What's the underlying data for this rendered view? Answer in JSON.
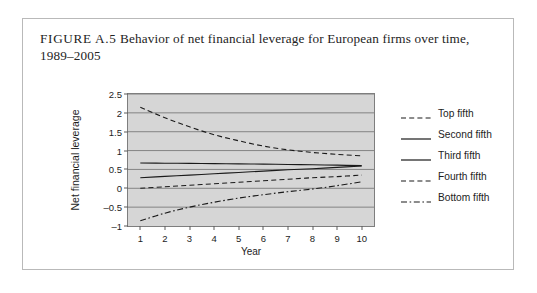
{
  "figure": {
    "label": "FIGURE A.5",
    "caption": "Behavior of net financial leverage for European firms over time, 1989–2005"
  },
  "colors": {
    "plot_background": "#d6d6d6",
    "grid": "#6f6f6f",
    "line": "#1a1a1a",
    "frame": "#7e7e7e",
    "card_border": "#b9b9b9"
  },
  "chart_data": {
    "type": "line",
    "title": "Behavior of net financial leverage for European firms over time, 1989–2005",
    "xlabel": "Year",
    "ylabel": "Net financial leverage",
    "x": [
      1,
      2,
      3,
      4,
      5,
      6,
      7,
      8,
      9,
      10
    ],
    "categories": [
      "1",
      "2",
      "3",
      "4",
      "5",
      "6",
      "7",
      "8",
      "9",
      "10"
    ],
    "xlim": [
      0.5,
      10.5
    ],
    "ylim": [
      -1,
      2.5
    ],
    "yticks": [
      -1,
      -0.5,
      0,
      0.5,
      1,
      1.5,
      2,
      2.5
    ],
    "ytick_labels": [
      "–1",
      "–0.5",
      "0",
      "0.5",
      "1",
      "1.5",
      "2",
      "2.5"
    ],
    "xticks": [
      1,
      2,
      3,
      4,
      5,
      6,
      7,
      8,
      9,
      10
    ],
    "grid": true,
    "grid_axis": "y",
    "legend_position": "right",
    "series": [
      {
        "name": "Top fifth",
        "style": "dashed",
        "values": [
          2.15,
          1.87,
          1.63,
          1.42,
          1.26,
          1.12,
          1.02,
          0.95,
          0.9,
          0.86
        ]
      },
      {
        "name": "Second fifth",
        "style": "solid",
        "values": [
          0.67,
          0.665,
          0.66,
          0.655,
          0.648,
          0.64,
          0.632,
          0.623,
          0.613,
          0.6
        ]
      },
      {
        "name": "Third fifth",
        "style": "solid",
        "values": [
          0.28,
          0.315,
          0.35,
          0.385,
          0.42,
          0.455,
          0.49,
          0.52,
          0.555,
          0.59
        ]
      },
      {
        "name": "Fourth fifth",
        "style": "dashed",
        "values": [
          0.0,
          0.04,
          0.08,
          0.12,
          0.16,
          0.2,
          0.24,
          0.28,
          0.31,
          0.35
        ]
      },
      {
        "name": "Bottom fifth",
        "style": "dashdot",
        "values": [
          -0.86,
          -0.66,
          -0.5,
          -0.37,
          -0.26,
          -0.17,
          -0.09,
          -0.02,
          0.07,
          0.17
        ]
      }
    ]
  },
  "legend": {
    "items": [
      {
        "label": "Top fifth",
        "style": "dashed"
      },
      {
        "label": "Second fifth",
        "style": "solid"
      },
      {
        "label": "Third fifth",
        "style": "solid"
      },
      {
        "label": "Fourth fifth",
        "style": "dashed"
      },
      {
        "label": "Bottom fifth",
        "style": "dashdot"
      }
    ]
  }
}
